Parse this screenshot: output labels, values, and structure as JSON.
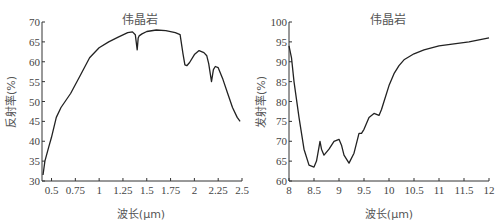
{
  "chart_data": [
    {
      "type": "line",
      "title": "伟晶岩",
      "xlabel": "波长(μm)",
      "ylabel": "反射率(%)",
      "xlim": [
        0.4,
        2.5
      ],
      "ylim": [
        30,
        70
      ],
      "xticks": [
        "0.5",
        "0.75",
        "1",
        "1.25",
        "1.5",
        "1.75",
        "2",
        "2.25",
        "2.5"
      ],
      "yticks": [
        "30",
        "35",
        "40",
        "45",
        "50",
        "55",
        "60",
        "65",
        "70"
      ],
      "grid": false,
      "series": [
        {
          "name": "伟晶岩",
          "x": [
            0.41,
            0.43,
            0.47,
            0.5,
            0.55,
            0.6,
            0.7,
            0.8,
            0.9,
            1.0,
            1.1,
            1.2,
            1.3,
            1.35,
            1.38,
            1.4,
            1.41,
            1.42,
            1.45,
            1.5,
            1.6,
            1.7,
            1.8,
            1.85,
            1.88,
            1.9,
            1.92,
            1.95,
            2.0,
            2.05,
            2.1,
            2.13,
            2.15,
            2.18,
            2.2,
            2.22,
            2.25,
            2.3,
            2.35,
            2.4,
            2.45,
            2.48
          ],
          "values": [
            31.5,
            35,
            38.5,
            41,
            46,
            48.5,
            52,
            56.5,
            61,
            63.5,
            65,
            66.2,
            67.3,
            67.5,
            66.8,
            63,
            66,
            66.5,
            67,
            67.6,
            68,
            67.8,
            67.3,
            66.8,
            62,
            59.2,
            59,
            59.8,
            61.8,
            62.8,
            62.3,
            61.5,
            59.5,
            55,
            58,
            58.8,
            58.5,
            55.5,
            52,
            48.5,
            46,
            45
          ]
        }
      ]
    },
    {
      "type": "line",
      "title": "伟晶岩",
      "xlabel": "波长(μm)",
      "ylabel": "发射率(%)",
      "xlim": [
        8,
        12
      ],
      "ylim": [
        60,
        100
      ],
      "xticks": [
        "8",
        "8.5",
        "9",
        "9.5",
        "10",
        "10.5",
        "11",
        "11.5",
        "12"
      ],
      "yticks": [
        "60",
        "65",
        "70",
        "75",
        "80",
        "85",
        "90",
        "95",
        "100"
      ],
      "grid": false,
      "series": [
        {
          "name": "伟晶岩",
          "x": [
            8.0,
            8.05,
            8.1,
            8.2,
            8.3,
            8.4,
            8.5,
            8.55,
            8.6,
            8.62,
            8.65,
            8.7,
            8.8,
            8.9,
            9.0,
            9.05,
            9.1,
            9.2,
            9.3,
            9.4,
            9.45,
            9.5,
            9.6,
            9.7,
            9.8,
            9.85,
            9.9,
            10.0,
            10.1,
            10.2,
            10.3,
            10.5,
            10.7,
            11.0,
            11.3,
            11.6,
            11.8,
            12.0
          ],
          "values": [
            94,
            91,
            85,
            76,
            68,
            64,
            63.5,
            65,
            68.5,
            70,
            68,
            66.5,
            68,
            70,
            70.5,
            69,
            66.5,
            64.5,
            67,
            72,
            72,
            73,
            76,
            77,
            76.5,
            78,
            80,
            84,
            87,
            89,
            90.5,
            92,
            93,
            94,
            94.5,
            95,
            95.5,
            96
          ]
        }
      ]
    }
  ],
  "left": {
    "title": "伟晶岩",
    "xlabel": "波长(μm)",
    "ylabel": "反射率(%)",
    "xticks": [
      "0.5",
      "0.75",
      "1",
      "1.25",
      "1.5",
      "1.75",
      "2",
      "2.25",
      "2.5"
    ],
    "yticks": [
      "30",
      "35",
      "40",
      "45",
      "50",
      "55",
      "60",
      "65",
      "70"
    ]
  },
  "right": {
    "title": "伟晶岩",
    "xlabel": "波长(μm)",
    "ylabel": "发射率(%)",
    "xticks": [
      "8",
      "8.5",
      "9",
      "9.5",
      "10",
      "10.5",
      "11",
      "11.5",
      "12"
    ],
    "yticks": [
      "60",
      "65",
      "70",
      "75",
      "80",
      "85",
      "90",
      "95",
      "100"
    ]
  },
  "colors": {
    "line": "#222222",
    "axis": "#333333",
    "text": "#444444"
  }
}
